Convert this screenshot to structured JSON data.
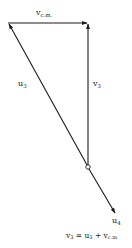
{
  "diagram": {
    "type": "vector-diagram",
    "points": {
      "top_left": [
        8,
        23
      ],
      "top_right": [
        88,
        23
      ],
      "origin": [
        88,
        167
      ],
      "u4_tip": [
        115,
        213
      ]
    },
    "vectors": [
      {
        "name": "v_cm",
        "label_main": "v",
        "label_sub": "c.m.",
        "from": "top_left",
        "to": "top_right"
      },
      {
        "name": "v3",
        "label_main": "v",
        "label_sub": "3",
        "from": "origin",
        "to": "top_right"
      },
      {
        "name": "u3",
        "label_main": "u",
        "label_sub": "3",
        "from": "origin",
        "to": "top_left"
      },
      {
        "name": "u4",
        "label_main": "u",
        "label_sub": "4",
        "from": "origin",
        "to": "u4_tip"
      }
    ],
    "labels": {
      "vcm_main": "v",
      "vcm_sub": "c.m.",
      "u3_main": "u",
      "u3_sub": "3",
      "v3_main": "v",
      "v3_sub": "3",
      "u4_main": "u",
      "u4_sub": "4"
    },
    "equation": {
      "lhs_main": "v",
      "lhs_sub": "3",
      "eq": " = ",
      "t1_main": "u",
      "t1_sub": "3",
      "plus": " + ",
      "t2_main": "v",
      "t2_sub": "c.m."
    },
    "colors": {
      "line": "#1a1a1a",
      "text": "#222222",
      "background": "#ffffff"
    }
  }
}
